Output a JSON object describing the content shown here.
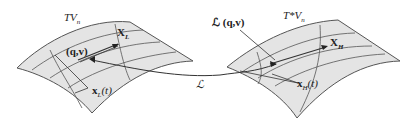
{
  "diagram": {
    "type": "legendre-transform-bundles",
    "left_surface": {
      "title": "TV",
      "title_sub": "n",
      "vector_field_label": "X",
      "vector_field_sub": "L",
      "point_label": "(q,v)",
      "curve_label": "x",
      "curve_sub": "L",
      "curve_arg": "(t)"
    },
    "right_surface": {
      "title": "T*V",
      "title_sub": "n",
      "vector_field_label": "X",
      "vector_field_sub": "H",
      "point_label": "ℒ (q,v)",
      "curve_label": "x",
      "curve_sub": "H",
      "curve_arg": "(t)"
    },
    "map_label": "ℒ",
    "colors": {
      "surface_fill": "#e4e4e4",
      "surface_edge": "#555555",
      "line": "#444444",
      "text": "#222222"
    }
  }
}
